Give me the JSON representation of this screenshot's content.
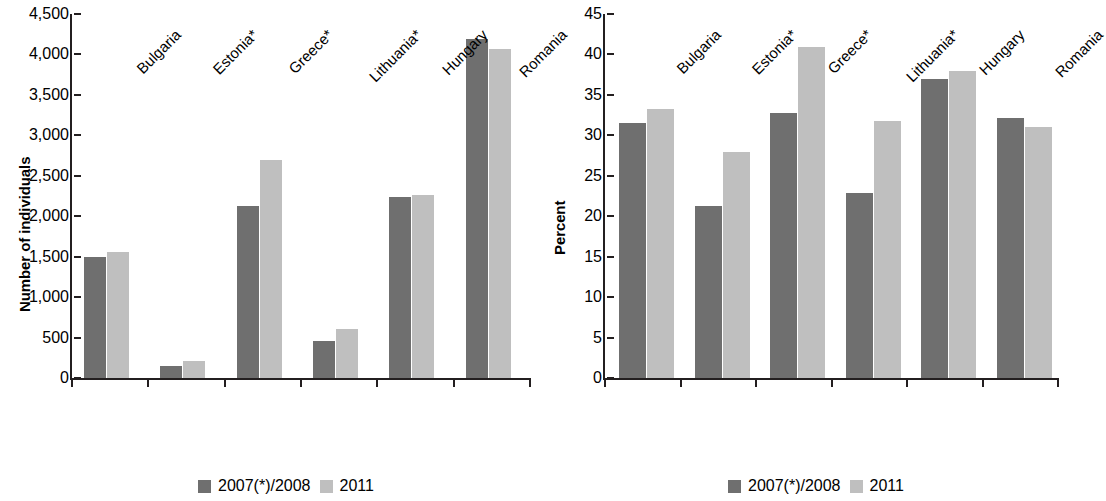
{
  "chart_data": [
    {
      "type": "bar",
      "panel": "left",
      "title": "",
      "xlabel": "",
      "ylabel": "Number of individuals",
      "categories": [
        "Bulgaria",
        "Estonia*",
        "Greece*",
        "Lithuania*",
        "Hungary",
        "Romania"
      ],
      "ylim": [
        0,
        4500
      ],
      "yticks": [
        0,
        500,
        1000,
        1500,
        2000,
        2500,
        3000,
        3500,
        4000,
        4500
      ],
      "ytick_labels": [
        "0",
        "500",
        "1,000",
        "1,500",
        "2,000",
        "2,500",
        "3,000",
        "3,500",
        "4,000",
        "4,500"
      ],
      "grid": false,
      "legend_position": "bottom",
      "series": [
        {
          "name": "2007(*)/2008",
          "color": "#6f6f6f",
          "values": [
            1490,
            150,
            2130,
            455,
            2240,
            4190
          ]
        },
        {
          "name": "2011",
          "color": "#bfbfbf",
          "values": [
            1560,
            215,
            2690,
            605,
            2265,
            4070
          ]
        }
      ]
    },
    {
      "type": "bar",
      "panel": "right",
      "title": "",
      "xlabel": "",
      "ylabel": "Percent",
      "categories": [
        "Bulgaria",
        "Estonia*",
        "Greece*",
        "Lithuania*",
        "Hungary",
        "Romania"
      ],
      "ylim": [
        0,
        45
      ],
      "yticks": [
        0,
        5,
        10,
        15,
        20,
        25,
        30,
        35,
        40,
        45
      ],
      "ytick_labels": [
        "0",
        "5",
        "10",
        "15",
        "20",
        "25",
        "30",
        "35",
        "40",
        "45"
      ],
      "grid": false,
      "legend_position": "bottom",
      "series": [
        {
          "name": "2007(*)/2008",
          "color": "#6f6f6f",
          "values": [
            31.5,
            21.3,
            32.8,
            22.9,
            37.0,
            32.1
          ]
        },
        {
          "name": "2011",
          "color": "#bfbfbf",
          "values": [
            33.3,
            28.0,
            40.9,
            31.8,
            38.0,
            31.0
          ]
        }
      ]
    }
  ],
  "legend": {
    "items": [
      {
        "label": "2007(*)/2008",
        "color": "#6f6f6f"
      },
      {
        "label": "2011",
        "color": "#bfbfbf"
      }
    ]
  }
}
